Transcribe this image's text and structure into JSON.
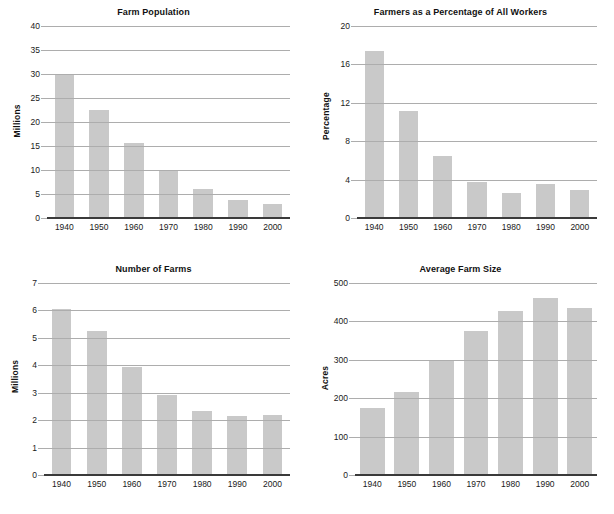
{
  "page": {
    "background": "#ffffff",
    "bar_color": "#c9c9c9",
    "gridline_color": "#adadad",
    "axis_color": "#3a3a3a",
    "text_color": "#1a1a1a"
  },
  "chart_data": [
    {
      "type": "bar",
      "title": "Farm Population",
      "xlabel": "",
      "ylabel": "Millions",
      "categories": [
        "1940",
        "1950",
        "1960",
        "1970",
        "1980",
        "1990",
        "2000"
      ],
      "values": [
        30.0,
        22.4,
        15.7,
        9.9,
        6.1,
        3.8,
        2.9
      ],
      "ylim": [
        0,
        40
      ],
      "yticks": [
        0,
        5,
        10,
        15,
        20,
        25,
        30,
        35,
        40
      ],
      "grid": true,
      "legend": "none"
    },
    {
      "type": "bar",
      "title": "Farmers as a Percentage of All Workers",
      "xlabel": "",
      "ylabel": "Percentage",
      "categories": [
        "1940",
        "1950",
        "1960",
        "1970",
        "1980",
        "1990",
        "2000"
      ],
      "values": [
        17.4,
        11.1,
        6.5,
        3.8,
        2.6,
        3.5,
        2.9
      ],
      "ylim": [
        0,
        20
      ],
      "yticks": [
        0,
        4,
        8,
        12,
        16,
        20
      ],
      "grid": true,
      "legend": "none"
    },
    {
      "type": "bar",
      "title": "Number of Farms",
      "xlabel": "",
      "ylabel": "Millions",
      "categories": [
        "1940",
        "1950",
        "1960",
        "1970",
        "1980",
        "1990",
        "2000"
      ],
      "values": [
        6.05,
        5.25,
        3.95,
        2.9,
        2.35,
        2.15,
        2.17
      ],
      "ylim": [
        0,
        7
      ],
      "yticks": [
        0,
        1,
        2,
        3,
        4,
        5,
        6,
        7
      ],
      "grid": true,
      "legend": "none"
    },
    {
      "type": "bar",
      "title": "Average Farm Size",
      "xlabel": "",
      "ylabel": "Acres",
      "categories": [
        "1940",
        "1950",
        "1960",
        "1970",
        "1980",
        "1990",
        "2000"
      ],
      "values": [
        175,
        216,
        300,
        374,
        426,
        460,
        434
      ],
      "ylim": [
        0,
        500
      ],
      "yticks": [
        0,
        100,
        200,
        300,
        400,
        500
      ],
      "grid": true,
      "legend": "none"
    }
  ],
  "layout": {
    "panels": [
      {
        "plot_left": 47,
        "plot_top": 26,
        "plot_width": 243,
        "plot_height": 192,
        "bar_width_ratio": 0.56,
        "ylabel_offset": 14
      },
      {
        "plot_left": 50,
        "plot_top": 26,
        "plot_width": 240,
        "plot_height": 192,
        "bar_width_ratio": 0.56,
        "ylabel_offset": 12
      },
      {
        "plot_left": 44,
        "plot_top": 26,
        "plot_width": 246,
        "plot_height": 192,
        "bar_width_ratio": 0.56,
        "ylabel_offset": 14
      },
      {
        "plot_left": 48,
        "plot_top": 26,
        "plot_width": 242,
        "plot_height": 192,
        "bar_width_ratio": 0.72,
        "ylabel_offset": 12
      }
    ]
  }
}
